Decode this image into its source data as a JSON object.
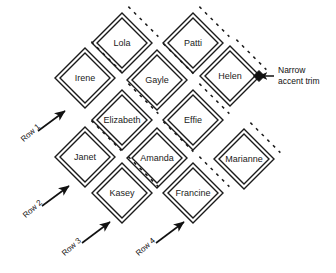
{
  "diagram": {
    "colors": {
      "stroke": "#1a1a1a",
      "trim": "#1a1a1a",
      "background": "#ffffff",
      "text": "#1a1a1a"
    },
    "geometry": {
      "half_width": 30,
      "half_height": 30,
      "inner_inset": 5,
      "trim_offset": 9,
      "trim_dash": "3 5"
    },
    "cells": [
      {
        "name": "Lola",
        "cx": 122,
        "cy": 43,
        "row": 1
      },
      {
        "name": "Patti",
        "cx": 193,
        "cy": 43,
        "row": 2
      },
      {
        "name": "Irene",
        "cx": 85,
        "cy": 78,
        "row": 1
      },
      {
        "name": "Gayle",
        "cx": 157,
        "cy": 80,
        "row": 2
      },
      {
        "name": "Helen",
        "cx": 230,
        "cy": 76,
        "row": 3
      },
      {
        "name": "Elizabeth",
        "cx": 122,
        "cy": 120,
        "row": 2
      },
      {
        "name": "Effie",
        "cx": 193,
        "cy": 120,
        "row": 3
      },
      {
        "name": "Janet",
        "cx": 85,
        "cy": 157,
        "row": 2
      },
      {
        "name": "Amanda",
        "cx": 157,
        "cy": 158,
        "row": 3
      },
      {
        "name": "Marianne",
        "cx": 244,
        "cy": 159,
        "row": 4
      },
      {
        "name": "Kasey",
        "cx": 122,
        "cy": 193,
        "row": 3
      },
      {
        "name": "Francine",
        "cx": 193,
        "cy": 193,
        "row": 4
      }
    ],
    "row_markers": [
      {
        "label": "Row 1",
        "text_x": 22,
        "text_y": 136,
        "angle": -42,
        "arrow_x1": 38,
        "arrow_y1": 131,
        "arrow_x2": 65,
        "arrow_y2": 111
      },
      {
        "label": "Row 2",
        "text_x": 24,
        "text_y": 212,
        "angle": -42,
        "arrow_x1": 42,
        "arrow_y1": 206,
        "arrow_x2": 69,
        "arrow_y2": 186
      },
      {
        "label": "Row 3",
        "text_x": 63,
        "text_y": 250,
        "angle": -42,
        "arrow_x1": 82,
        "arrow_y1": 243,
        "arrow_x2": 110,
        "arrow_y2": 222
      },
      {
        "label": "Row 4",
        "text_x": 137,
        "text_y": 250,
        "angle": -42,
        "arrow_x1": 156,
        "arrow_y1": 243,
        "arrow_x2": 184,
        "arrow_y2": 222
      }
    ],
    "callout": {
      "line1": "Narrow",
      "line2": "accent trim",
      "text_x": 278,
      "text_y": 65,
      "arrow_from_x": 274,
      "arrow_from_y": 76,
      "arrow_to_x": 259,
      "arrow_to_y": 76,
      "marker_x": 259,
      "marker_y": 76
    }
  }
}
